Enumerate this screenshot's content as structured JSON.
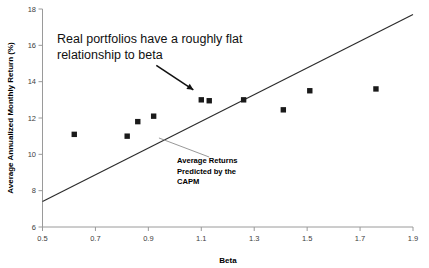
{
  "chart_data": {
    "type": "scatter",
    "title": "",
    "xlabel": "Beta",
    "ylabel": "Average Annualized Monthly Return (%)",
    "xlim": [
      0.5,
      1.9
    ],
    "ylim": [
      6,
      18
    ],
    "xticks": [
      "0.5",
      "0.7",
      "0.9",
      "1.1",
      "1.3",
      "1.5",
      "1.7",
      "1.9"
    ],
    "xtick_values": [
      0.5,
      0.7,
      0.9,
      1.1,
      1.3,
      1.5,
      1.7,
      1.9
    ],
    "yticks": [
      "6",
      "8",
      "10",
      "12",
      "14",
      "16",
      "18"
    ],
    "ytick_values": [
      6,
      8,
      10,
      12,
      14,
      16,
      18
    ],
    "grid": false,
    "legend": "none",
    "series": [
      {
        "name": "Real portfolios",
        "type": "scatter",
        "marker": "square",
        "color": "#1a1a1a",
        "points": [
          {
            "x": 0.62,
            "y": 11.1
          },
          {
            "x": 0.82,
            "y": 11.0
          },
          {
            "x": 0.86,
            "y": 11.8
          },
          {
            "x": 0.92,
            "y": 12.1
          },
          {
            "x": 1.1,
            "y": 13.0
          },
          {
            "x": 1.13,
            "y": 12.95
          },
          {
            "x": 1.26,
            "y": 13.0
          },
          {
            "x": 1.41,
            "y": 12.45
          },
          {
            "x": 1.51,
            "y": 13.5
          },
          {
            "x": 1.76,
            "y": 13.6
          }
        ]
      },
      {
        "name": "Average Returns Predicted by the CAPM",
        "type": "line",
        "color": "#2b2b2b",
        "points": [
          {
            "x": 0.5,
            "y": 7.4
          },
          {
            "x": 1.9,
            "y": 17.7
          }
        ]
      }
    ],
    "annotations": [
      {
        "id": "flat-relationship",
        "lines": [
          "Real portfolios have a roughly flat",
          "relationship to beta"
        ],
        "x": 0.62,
        "y": 16.6,
        "arrow_from": {
          "x": 0.93,
          "y": 14.9
        },
        "arrow_to": {
          "x": 1.07,
          "y": 13.55
        }
      },
      {
        "id": "capm-label",
        "lines": [
          "Average Returns",
          "Predicted by the",
          "CAPM"
        ],
        "x": 1.17,
        "y": 9.95,
        "leader_from": {
          "x": 1.13,
          "y": 9.85
        },
        "leader_to": {
          "x": 0.94,
          "y": 10.9
        }
      }
    ]
  }
}
